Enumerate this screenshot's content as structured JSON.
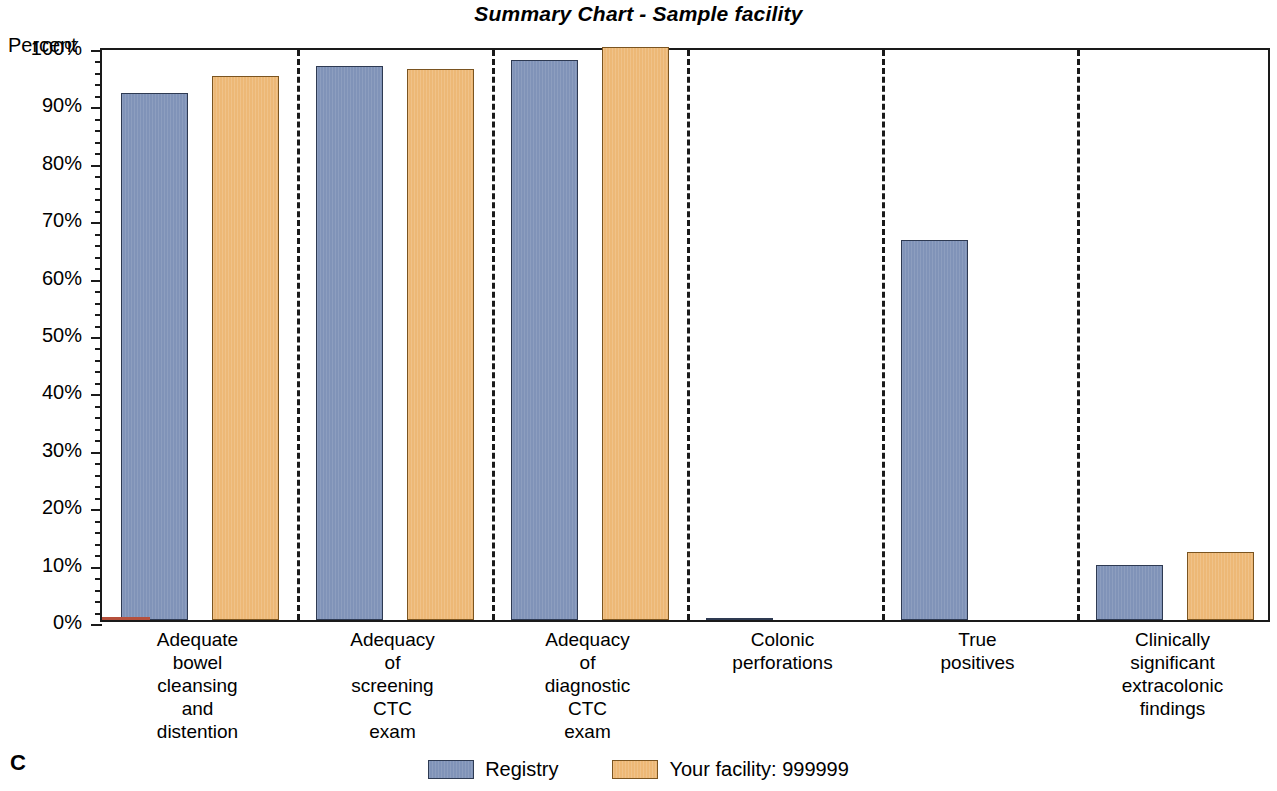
{
  "title": "Summary Chart - Sample facility",
  "panel_letter": "C",
  "axis": {
    "y_title": "Percent",
    "y_ticks": [
      "0%",
      "10%",
      "20%",
      "30%",
      "40%",
      "50%",
      "60%",
      "70%",
      "80%",
      "90%",
      "100%"
    ]
  },
  "legend": {
    "position": "bottom-center",
    "items": [
      {
        "label": "Registry",
        "color": "#8093b8",
        "key": "registry"
      },
      {
        "label": "Your facility: 999999",
        "color": "#edb876",
        "key": "facility"
      }
    ]
  },
  "chart_data": {
    "type": "bar",
    "title": "Summary Chart - Sample facility",
    "xlabel": "",
    "ylabel": "Percent",
    "ylim": [
      0,
      100
    ],
    "y_tick_step": 10,
    "y_minor_tick_step": 2,
    "grid": false,
    "group_separators": true,
    "categories": [
      "Adequate\nbowel\ncleansing\nand\ndistention",
      "Adequacy\nof\nscreening\nCTC\nexam",
      "Adequacy\nof\ndiagnostic\nCTC\nexam",
      "Colonic\nperforations",
      "True\npositives",
      "Clinically\nsignificant\nextracolonic\nfindings"
    ],
    "series": [
      {
        "name": "Registry",
        "color": "#8093b8",
        "values": [
          91.8,
          96.5,
          97.6,
          0.3,
          66.2,
          9.6
        ]
      },
      {
        "name": "Your facility: 999999",
        "color": "#edb876",
        "values": [
          94.7,
          96.0,
          99.8,
          null,
          null,
          11.8
        ]
      }
    ]
  }
}
